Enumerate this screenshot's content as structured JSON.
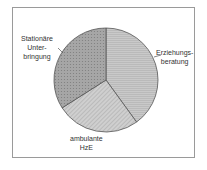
{
  "chart_data": {
    "type": "pie",
    "title": "",
    "slices": [
      {
        "label": "Erziehungsberatung",
        "label_lines": [
          "Erziehungs-",
          "beratung"
        ],
        "value": 40,
        "color": "#c4c4c4",
        "pattern": "horizontal-lines"
      },
      {
        "label": "ambulante HzE",
        "label_lines": [
          "ambulante",
          "HzE"
        ],
        "value": 26,
        "color": "#c8c8c8",
        "pattern": "diagonal-lines"
      },
      {
        "label": "Stationäre Unterbringung",
        "label_lines": [
          "Stationäre",
          "Unter-",
          "bringung"
        ],
        "value": 34,
        "color": "#a9a9a9",
        "pattern": "dots"
      }
    ],
    "start_angle": "12 o'clock",
    "direction": "clockwise",
    "legend": "none (direct labels)"
  },
  "labels": {
    "erz_1": "Erziehungs-",
    "erz_2": "beratung",
    "amb_1": "ambulante",
    "amb_2": "HzE",
    "sta_1": "Stationäre",
    "sta_2": "Unter-",
    "sta_3": "bringung"
  }
}
